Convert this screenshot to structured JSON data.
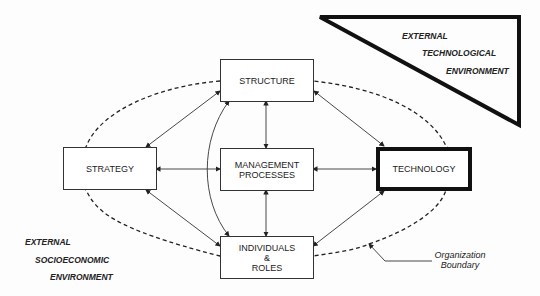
{
  "diagram": {
    "nodes": [
      {
        "id": "structure",
        "label": "STRUCTURE"
      },
      {
        "id": "strategy",
        "label": "STRATEGY"
      },
      {
        "id": "management",
        "label_line1": "MANAGEMENT",
        "label_line2": "PROCESSES"
      },
      {
        "id": "technology",
        "label": "TECHNOLOGY"
      },
      {
        "id": "individuals",
        "label_line1": "INDIVIDUALS",
        "label_line2": "&",
        "label_line3": "ROLES"
      }
    ],
    "tech_env": {
      "line1": "EXTERNAL",
      "line2": "TECHNOLOGICAL",
      "line3": "ENVIRONMENT"
    },
    "socio_env": {
      "line1": "EXTERNAL",
      "line2": "SOCIOECONOMIC",
      "line3": "ENVIRONMENT"
    },
    "boundary": {
      "line1": "Organization",
      "line2": "Boundary"
    },
    "edges": [
      [
        "strategy",
        "structure"
      ],
      [
        "structure",
        "technology"
      ],
      [
        "strategy",
        "individuals"
      ],
      [
        "individuals",
        "technology"
      ],
      [
        "strategy",
        "management"
      ],
      [
        "management",
        "technology"
      ],
      [
        "structure",
        "management"
      ],
      [
        "management",
        "individuals"
      ],
      [
        "structure",
        "individuals"
      ]
    ]
  }
}
